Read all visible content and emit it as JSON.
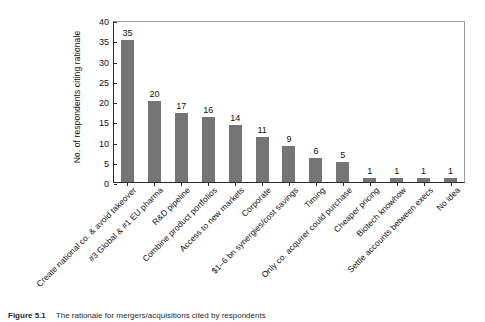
{
  "chart_data": {
    "type": "bar",
    "title": "",
    "xlabel": "",
    "ylabel": "No. of respondents citing rationale",
    "ylim": [
      0,
      40
    ],
    "yticks": [
      0,
      5,
      10,
      15,
      20,
      25,
      30,
      35,
      40
    ],
    "grid": false,
    "legend": null,
    "bar_color": "#757575",
    "categories": [
      "Create national co. & avoid takeover",
      "#3 Global & #1 EU pharma",
      "R&D pipeline",
      "Combine product portfolios",
      "Access to new markets",
      "Corporate",
      "$1–6 bn synergies/cost savings",
      "Timing",
      "Only co. acquirer could purchase",
      "Cheaper pricing",
      "Biotech knowhow",
      "Settle accounts between execs",
      "No idea"
    ],
    "values": [
      35,
      20,
      17,
      16,
      14,
      11,
      9,
      6,
      5,
      1,
      1,
      1,
      1
    ],
    "data_labels": [
      "35",
      "20",
      "17",
      "16",
      "14",
      "11",
      "9",
      "6",
      "5",
      "1",
      "1",
      "1",
      "1"
    ]
  },
  "caption": {
    "number": "Figure 5.1",
    "text": "The rationale for mergers/acquisitions cited by respondents"
  }
}
